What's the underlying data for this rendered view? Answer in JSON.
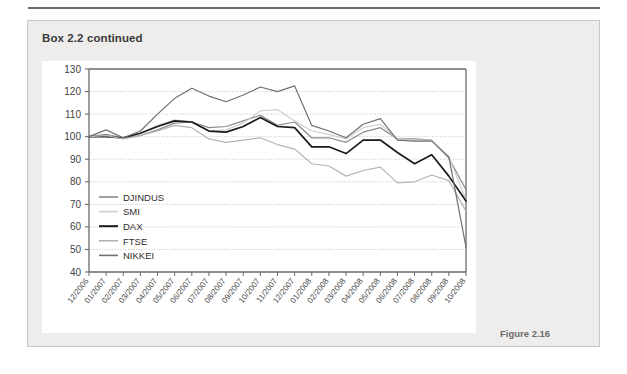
{
  "box": {
    "title": "Box 2.2 continued",
    "figure_caption": "Figure 2.16"
  },
  "chart_data": {
    "type": "line",
    "title": "",
    "subtitle": "",
    "xlabel": "",
    "ylabel": "",
    "ylim": [
      40,
      130
    ],
    "ytick_step": 10,
    "yticks": [
      130,
      120,
      110,
      100,
      90,
      80,
      70,
      60,
      50,
      40
    ],
    "grid": true,
    "legend_position": "inside-bottom-left",
    "x": [
      "12/2006",
      "01/2007",
      "02/2007",
      "03/2007",
      "04/2007",
      "05/2007",
      "06/2007",
      "07/2007",
      "08/2007",
      "09/2007",
      "10/2007",
      "11/2007",
      "12/2007",
      "01/2008",
      "02/2008",
      "03/2008",
      "04/2008",
      "05/2008",
      "06/2008",
      "07/2008",
      "08/2008",
      "09/2008",
      "10/2008"
    ],
    "categories": [
      "12/2006",
      "01/2007",
      "02/2007",
      "03/2007",
      "04/2007",
      "05/2007",
      "06/2007",
      "07/2007",
      "08/2007",
      "09/2007",
      "10/2007",
      "11/2007",
      "12/2007",
      "01/2008",
      "02/2008",
      "03/2008",
      "04/2008",
      "05/2008",
      "06/2008",
      "07/2008",
      "08/2008",
      "09/2008",
      "10/2008"
    ],
    "series": [
      {
        "name": "DJINDUS",
        "color": "#8a8a8a",
        "values": [
          100,
          101,
          99.5,
          100.5,
          103,
          106,
          106.5,
          104,
          104.5,
          107,
          109.5,
          105,
          106.5,
          99.5,
          99.5,
          97.5,
          102,
          104,
          99,
          99,
          98.5,
          90.5,
          76.5
        ]
      },
      {
        "name": "SMI",
        "color": "#cfcfcf",
        "values": [
          100,
          100.5,
          99.5,
          101.5,
          105,
          107.5,
          106.5,
          102.5,
          103,
          106,
          111.5,
          112,
          107,
          102.5,
          101,
          99,
          104,
          105.5,
          99,
          98.5,
          98.5,
          91,
          72
        ]
      },
      {
        "name": "DAX",
        "color": "#1a1a1a",
        "values": [
          100,
          100,
          99.5,
          101.5,
          104.5,
          107,
          106.5,
          102.5,
          102,
          104.5,
          108.5,
          104.5,
          104,
          95.5,
          95.5,
          92.5,
          98.5,
          98.5,
          93,
          88,
          92,
          82.5,
          71.5
        ]
      },
      {
        "name": "FTSE",
        "color": "#b4b4b4",
        "values": [
          100,
          100.5,
          99,
          100.5,
          102.5,
          105,
          104,
          99,
          97.5,
          98.5,
          99.5,
          96.5,
          94.5,
          88,
          87,
          82.5,
          85,
          86.5,
          79.5,
          80,
          83,
          80.5,
          67
        ]
      },
      {
        "name": "NIKKEI",
        "color": "#707070",
        "values": [
          100,
          103,
          99.5,
          102.5,
          110,
          117,
          121.5,
          118,
          115.5,
          118.5,
          122,
          120,
          122.5,
          105,
          102.5,
          99.5,
          105.5,
          108,
          98.5,
          98,
          98,
          91,
          51
        ]
      }
    ],
    "legend": [
      {
        "label": "DJINDUS",
        "color": "#8a8a8a"
      },
      {
        "label": "SMI",
        "color": "#cfcfcf"
      },
      {
        "label": "DAX",
        "color": "#1a1a1a"
      },
      {
        "label": "FTSE",
        "color": "#b4b4b4"
      },
      {
        "label": "NIKKEI",
        "color": "#707070"
      }
    ],
    "axis_color": "#6a6a6a",
    "grid_color": "#b8b8b8"
  }
}
